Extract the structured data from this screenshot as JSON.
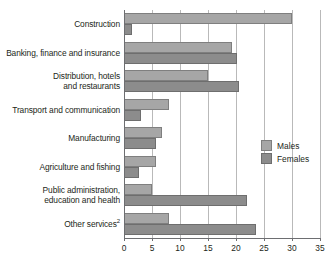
{
  "chart_data": {
    "type": "bar",
    "orientation": "horizontal",
    "title": "",
    "subtitle": "",
    "xlabel": "",
    "ylabel": "",
    "xlim": [
      0,
      35
    ],
    "xticks": [
      0,
      5,
      10,
      15,
      20,
      25,
      30,
      35
    ],
    "xtick_labels": [
      "0",
      "5",
      "10",
      "15",
      "20",
      "25",
      "30",
      "35"
    ],
    "grid": true,
    "grid_axis": "x",
    "legend_position": "center-right",
    "categories": [
      "Construction",
      "Banking, finance and insurance",
      "Distribution, hotels\nand restaurants",
      "Transport and communication",
      "Manufacturing",
      "Agriculture and fishing",
      "Public administration,\neducation and health",
      "Other services"
    ],
    "category_superscripts": [
      "",
      "",
      "",
      "",
      "",
      "",
      "",
      "2"
    ],
    "series": [
      {
        "name": "Males",
        "color": "#a6a6a6",
        "values": [
          30.0,
          19.2,
          15.0,
          8.0,
          6.8,
          5.8,
          5.0,
          8.0
        ]
      },
      {
        "name": "Females",
        "color": "#8c8c8c",
        "values": [
          1.5,
          20.2,
          20.6,
          3.0,
          5.7,
          2.7,
          22.0,
          23.5
        ]
      }
    ]
  },
  "legend": {
    "items": [
      {
        "label": "Males",
        "swatch": "males"
      },
      {
        "label": "Females",
        "swatch": "females"
      }
    ]
  },
  "colors": {
    "males": "#a6a6a6",
    "females": "#8c8c8c",
    "axis": "#6d6e71",
    "grid": "#b9b9b9",
    "text": "#231f20",
    "background": "#ffffff"
  }
}
